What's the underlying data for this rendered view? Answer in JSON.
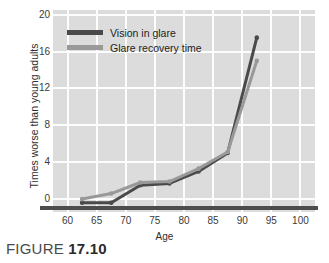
{
  "caption": {
    "word": "FIGURE",
    "number": "17.10"
  },
  "colors": {
    "plot_background": "#dcdcdc",
    "gridline": "#fdfdfd",
    "series_vision_in_glare": "#4a4a4a",
    "series_glare_recovery_time": "#999999",
    "axis_baseline": "#4d4d4d",
    "tick_text": "#3a3a3a"
  },
  "chart_data": {
    "type": "line",
    "title": "",
    "xlabel": "Age",
    "ylabel": "Times worse than young adults",
    "xlim": [
      57.5,
      102.5
    ],
    "ylim": [
      -1.4,
      20.5
    ],
    "xticks": [
      60,
      65,
      70,
      75,
      80,
      85,
      90,
      95,
      100
    ],
    "yticks": [
      0,
      4,
      8,
      12,
      16,
      20
    ],
    "xtick_labels": [
      "60",
      "65",
      "70",
      "75",
      "80",
      "85",
      "90",
      "95",
      "100"
    ],
    "ytick_labels": [
      "0",
      "4",
      "8",
      "12",
      "16",
      "20"
    ],
    "grid": true,
    "legend_position": "upper-left-inside",
    "x": [
      62.5,
      67.5,
      72.5,
      77.5,
      82.5,
      87.5,
      92.5
    ],
    "series": [
      {
        "name": "Vision in glare",
        "color": "#4a4a4a",
        "values": [
          -0.4,
          -0.4,
          1.5,
          1.7,
          3.0,
          5.0,
          17.5
        ]
      },
      {
        "name": "Glare recovery time",
        "color": "#999999",
        "values": [
          0.0,
          0.6,
          1.8,
          1.9,
          3.3,
          5.1,
          15.0
        ]
      }
    ]
  }
}
